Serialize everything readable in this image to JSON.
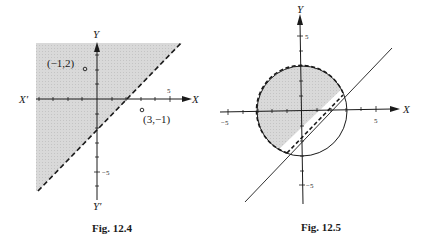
{
  "figures": [
    {
      "caption": "Fig. 12.4",
      "axes": {
        "x_label": "X",
        "x_neg_label": "X′",
        "y_label": "Y",
        "y_neg_label": "Y′",
        "x_tick_label": "5",
        "y_tick_label": "−5"
      },
      "boundary": {
        "equation": "y = x − 2",
        "style": "dashed"
      },
      "shaded_region": "above dashed line",
      "points": [
        {
          "label": "(−1,2)",
          "x": -1,
          "y": 2
        },
        {
          "label": "(3,−1)",
          "x": 3,
          "y": -1
        }
      ]
    },
    {
      "caption": "Fig. 12.5",
      "axes": {
        "x_label": "X",
        "y_label": "Y",
        "x_tick_pos": "5",
        "x_tick_neg": "−5",
        "y_tick_pos": "5",
        "y_tick_neg": "−5"
      },
      "circle": {
        "center": [
          0,
          0
        ],
        "radius": 3
      },
      "line": {
        "equation": "y = x − 2"
      },
      "shaded_region": "inside circle and above line (dashed boundaries)"
    }
  ],
  "colors": {
    "shade": "#d6d6d6",
    "ink": "#1a1a1a"
  }
}
